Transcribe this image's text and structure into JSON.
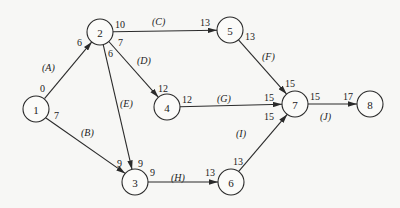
{
  "diagram": {
    "type": "activity-on-arrow network",
    "nodes": [
      {
        "id": "1",
        "x": 36,
        "y": 109
      },
      {
        "id": "2",
        "x": 100,
        "y": 32
      },
      {
        "id": "3",
        "x": 135,
        "y": 182
      },
      {
        "id": "4",
        "x": 167,
        "y": 107
      },
      {
        "id": "5",
        "x": 230,
        "y": 30
      },
      {
        "id": "6",
        "x": 231,
        "y": 182
      },
      {
        "id": "7",
        "x": 295,
        "y": 104
      },
      {
        "id": "8",
        "x": 370,
        "y": 104
      }
    ],
    "edges": [
      {
        "from": "1",
        "to": "2",
        "activity": "(A)",
        "start_label": "0",
        "end_label": "6"
      },
      {
        "from": "1",
        "to": "3",
        "activity": "(B)",
        "start_label": "7",
        "end_label": "9"
      },
      {
        "from": "2",
        "to": "5",
        "activity": "(C)",
        "start_label": "10",
        "end_label": "13"
      },
      {
        "from": "2",
        "to": "4",
        "activity": "(D)",
        "start_label": "7",
        "end_label": "12"
      },
      {
        "from": "2",
        "to": "3",
        "activity": "(E)",
        "start_label": "6",
        "end_label": "9"
      },
      {
        "from": "5",
        "to": "7",
        "activity": "(F)",
        "start_label": "13",
        "end_label": "15"
      },
      {
        "from": "4",
        "to": "7",
        "activity": "(G)",
        "start_label": "12",
        "end_label": "15"
      },
      {
        "from": "3",
        "to": "6",
        "activity": "(H)",
        "start_label": "9",
        "end_label": "13"
      },
      {
        "from": "6",
        "to": "7",
        "activity": "(I)",
        "start_label": "13",
        "end_label": "15"
      },
      {
        "from": "7",
        "to": "8",
        "activity": "(J)",
        "start_label": "15",
        "end_label": "17"
      }
    ]
  },
  "labels": {
    "n1": "1",
    "n2": "2",
    "n3": "3",
    "n4": "4",
    "n5": "5",
    "n6": "6",
    "n7": "7",
    "n8": "8",
    "A": "(A)",
    "B": "(B)",
    "C": "(C)",
    "D": "(D)",
    "E": "(E)",
    "F": "(F)",
    "G": "(G)",
    "H": "(H)",
    "I": "(I)",
    "J": "(J)",
    "A_start": "0",
    "A_end": "6",
    "B_start": "7",
    "B_end": "9",
    "C_start": "10",
    "C_end": "13",
    "D_start": "7",
    "D_end": "12",
    "E_start": "6",
    "E_end": "9",
    "F_start": "13",
    "F_end": "15",
    "G_start": "12",
    "G_end": "15",
    "H_start": "9",
    "H_end": "13",
    "I_start": "13",
    "I_end": "15",
    "J_start": "15",
    "J_end": "17"
  }
}
